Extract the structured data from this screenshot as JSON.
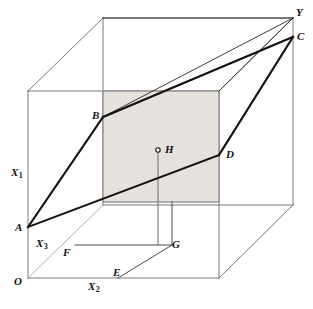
{
  "figure": {
    "kind": "3d-geometry-diagram",
    "width": 313,
    "height": 309,
    "background_color": "#ffffff",
    "line_color": "#15120f",
    "thin_line_color": "#5d5d5d",
    "faint_line_color": "#9a9a9a",
    "shade_fill": "#e4e1dc",
    "shade_stroke": "#b8b3ac"
  },
  "vertex_labels": [
    {
      "id": "O",
      "text": "O",
      "x": 14,
      "y": 276,
      "sub": ""
    },
    {
      "id": "A",
      "text": "A",
      "x": 15,
      "y": 222,
      "sub": ""
    },
    {
      "id": "B",
      "text": "B",
      "x": 92,
      "y": 110,
      "sub": ""
    },
    {
      "id": "C",
      "text": "C",
      "x": 297,
      "y": 31,
      "sub": ""
    },
    {
      "id": "D",
      "text": "D",
      "x": 226,
      "y": 149,
      "sub": ""
    },
    {
      "id": "E",
      "text": "E",
      "x": 113,
      "y": 267,
      "sub": ""
    },
    {
      "id": "F",
      "text": "F",
      "x": 63,
      "y": 247,
      "sub": ""
    },
    {
      "id": "G",
      "text": "G",
      "x": 172,
      "y": 239,
      "sub": ""
    },
    {
      "id": "H",
      "text": "H",
      "x": 165,
      "y": 144,
      "sub": ""
    },
    {
      "id": "Y",
      "text": "Y",
      "x": 296,
      "y": 7,
      "sub": ""
    }
  ],
  "axis_labels": [
    {
      "id": "X1",
      "text": "X",
      "sub": "1",
      "x": 11,
      "y": 167
    },
    {
      "id": "X2",
      "text": "X",
      "sub": "2",
      "x": 88,
      "y": 281
    },
    {
      "id": "X3",
      "text": "X",
      "sub": "3",
      "x": 36,
      "y": 238
    }
  ],
  "geometry": {
    "cube": {
      "front_face": {
        "left": 28,
        "top": 91,
        "right": 219,
        "bottom": 278
      },
      "back_face": {
        "left": 103,
        "top": 18,
        "right": 293,
        "bottom": 207
      },
      "depth_offset": {
        "dx": 75,
        "dy": -73
      }
    },
    "plane_polygon": {
      "points": "28,227 103,117 293,37 219,155",
      "label": "ABCD"
    },
    "shaded_rect": {
      "x": 103,
      "y": 91,
      "width": 116,
      "height": 111
    },
    "point_H": {
      "x": 158,
      "y": 150,
      "marker_radius": 2.2
    },
    "point_G": {
      "x": 172,
      "y": 245
    },
    "segment_FG": {
      "x1": 75,
      "y1": 245,
      "x2": 172,
      "y2": 245
    },
    "segment_EG": {
      "x1": 118,
      "y1": 278,
      "x2": 172,
      "y2": 245
    },
    "axis_X3_line": {
      "x1": 28,
      "y1": 278,
      "x2": 103,
      "y2": 205
    }
  }
}
